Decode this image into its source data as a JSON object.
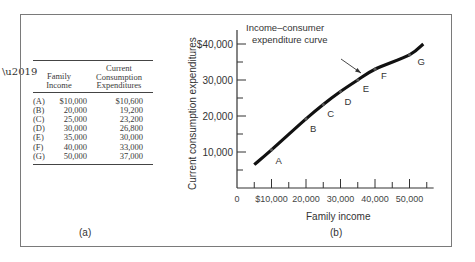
{
  "panel_a": {
    "label": "(a)",
    "table": {
      "headers": [
        "Family Income",
        "Current Consumption Expenditures"
      ],
      "header_lines": {
        "income": [
          "Family",
          "Income"
        ],
        "expenditure": [
          "Current",
          "Consumption",
          "Expenditures"
        ]
      },
      "rows": [
        {
          "label": "(A)",
          "income": "$10,000",
          "expenditure": "$10,600"
        },
        {
          "label": "(B)",
          "income": "20,000",
          "expenditure": "19,200"
        },
        {
          "label": "(C)",
          "income": "25,000",
          "expenditure": "23,200"
        },
        {
          "label": "(D)",
          "income": "30,000",
          "expenditure": "26,800"
        },
        {
          "label": "(E)",
          "income": "35,000",
          "expenditure": "30,000"
        },
        {
          "label": "(F)",
          "income": "40,000",
          "expenditure": "33,000"
        },
        {
          "label": "(G)",
          "income": "50,000",
          "expenditure": "37,000"
        }
      ]
    }
  },
  "panel_b": {
    "label": "(b)",
    "xlabel": "Family income",
    "ylabel": "Current consumption expenditures",
    "annotation": [
      "Income–consumer",
      "expenditure curve"
    ],
    "x_ticks": [
      "0",
      "$10,000",
      "20,000",
      "30,000",
      "40,000",
      "50,000"
    ],
    "y_ticks": [
      "10,000",
      "20,000",
      "30,000",
      "$40,000"
    ]
  },
  "chart_data": {
    "type": "line",
    "xlabel": "Family income",
    "ylabel": "Current consumption expenditures",
    "xlim": [
      0,
      57000
    ],
    "ylim": [
      0,
      44000
    ],
    "grid": false,
    "legend": "none",
    "x_tick_values": [
      0,
      10000,
      20000,
      30000,
      40000,
      50000
    ],
    "y_tick_values": [
      10000,
      20000,
      30000,
      40000
    ],
    "series": [
      {
        "name": "Income–consumer expenditure curve",
        "points": [
          {
            "label": "A",
            "x": 10000,
            "y": 10600
          },
          {
            "label": "B",
            "x": 20000,
            "y": 19200
          },
          {
            "label": "C",
            "x": 25000,
            "y": 23200
          },
          {
            "label": "D",
            "x": 30000,
            "y": 26800
          },
          {
            "label": "E",
            "x": 35000,
            "y": 30000
          },
          {
            "label": "F",
            "x": 40000,
            "y": 33000
          },
          {
            "label": "G",
            "x": 50000,
            "y": 37000
          }
        ],
        "curve_extent": {
          "x_start": 5000,
          "y_start": 6500,
          "x_end": 54000,
          "y_end": 40000
        }
      }
    ]
  }
}
